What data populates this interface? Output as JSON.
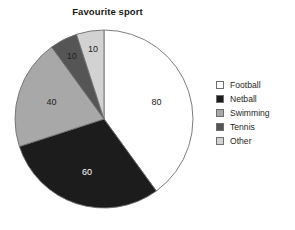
{
  "chart_data": {
    "type": "pie",
    "title": "Favourite sport",
    "categories": [
      "Football",
      "Netball",
      "Swimming",
      "Tennis",
      "Other"
    ],
    "values": [
      80,
      60,
      40,
      10,
      10
    ],
    "total": 200,
    "start_angle_deg": 0,
    "direction": "clockwise",
    "colors": [
      "#ffffff",
      "#1c1c1c",
      "#a8a8a8",
      "#555555",
      "#d2d2d2"
    ],
    "label_text_colors": [
      "#222222",
      "#ffffff",
      "#222222",
      "#222222",
      "#222222"
    ],
    "slice_outline": "#6e6e6e",
    "legend_position": "right",
    "grid": false,
    "data_labels": [
      "80",
      "60",
      "40",
      "10",
      "10"
    ],
    "xlabel": "",
    "ylabel": ""
  },
  "legend": {
    "items": [
      {
        "label": "Football"
      },
      {
        "label": "Netball"
      },
      {
        "label": "Swimming"
      },
      {
        "label": "Tennis"
      },
      {
        "label": "Other"
      }
    ]
  }
}
